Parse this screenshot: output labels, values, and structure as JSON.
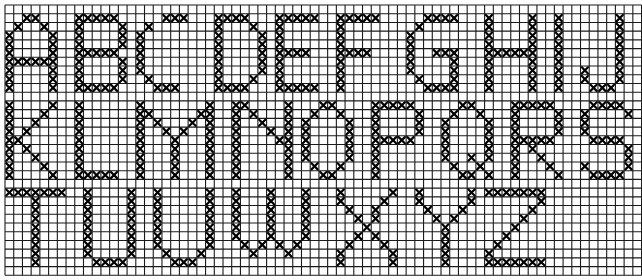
{
  "grid": {
    "origin_x": 5,
    "origin_y": 5,
    "pitch": 8.72,
    "cols": 73,
    "rows": 31,
    "line_color": "#1a1a1a",
    "stitch_color": "#000000"
  },
  "letters": [
    {
      "char": "A",
      "row0": 1,
      "col0": 0,
      "pattern": [
        "..XX..",
        ".X..X.",
        "X....X",
        "X....X",
        "X....X",
        "XXXXXX",
        "X....X",
        "X....X",
        "X....X"
      ]
    },
    {
      "char": "B",
      "row0": 1,
      "col0": 8,
      "pattern": [
        "XXXXX.",
        "X....X",
        "X....X",
        "X....X",
        "XXXXX.",
        "X....X",
        "X....X",
        "X....X",
        "XXXXX."
      ]
    },
    {
      "char": "C",
      "row0": 1,
      "col0": 15,
      "pattern": [
        "...XXX",
        ".X....",
        "X.....",
        "X.....",
        "X.....",
        "X.....",
        "X.....",
        ".X....",
        "..XXX."
      ]
    },
    {
      "char": "D",
      "row0": 1,
      "col0": 24,
      "pattern": [
        "XXXX..",
        "X...X.",
        "X....X",
        "X....X",
        "X....X",
        "X....X",
        "X....X",
        "X...X.",
        "XXXX.."
      ]
    },
    {
      "char": "E",
      "row0": 1,
      "col0": 31,
      "pattern": [
        "XXXXX",
        "X....",
        "X....",
        "X....",
        "XXXX.",
        "X....",
        "X....",
        "X....",
        "XXXXX"
      ]
    },
    {
      "char": "F",
      "row0": 1,
      "col0": 38,
      "pattern": [
        "XXXXX",
        "X....",
        "X....",
        "X....",
        "XXXX.",
        "X....",
        "X....",
        "X....",
        "X...."
      ]
    },
    {
      "char": "G",
      "row0": 1,
      "col0": 46,
      "pattern": [
        "..XXXX",
        ".X....",
        "X.....",
        "X.....",
        "X..XXX",
        "X....X",
        "X....X",
        ".X...X",
        "..XXXX"
      ]
    },
    {
      "char": "H",
      "row0": 1,
      "col0": 55,
      "pattern": [
        "X....X",
        "X....X",
        "X....X",
        "X....X",
        "XXXXXX",
        "X....X",
        "X....X",
        "X....X",
        "X....X"
      ]
    },
    {
      "char": "I",
      "row0": 1,
      "col0": 63,
      "pattern": [
        "X",
        "X",
        "X",
        "X",
        "X",
        "X",
        "X",
        "X",
        "X"
      ]
    },
    {
      "char": "J",
      "row0": 1,
      "col0": 66,
      "pattern": [
        "....X",
        "....X",
        "....X",
        "....X",
        "....X",
        "....X",
        "X...X",
        "X...X",
        ".XXX."
      ]
    },
    {
      "char": "K",
      "row0": 11,
      "col0": 0,
      "pattern": [
        "X....X",
        "X...X.",
        "X..X..",
        "X.X...",
        "XX....",
        "X.X...",
        "X..X..",
        "X...X.",
        "X....X"
      ]
    },
    {
      "char": "L",
      "row0": 11,
      "col0": 8,
      "pattern": [
        "X....",
        "X....",
        "X....",
        "X....",
        "X....",
        "X....",
        "X....",
        "X....",
        "XXXXX"
      ]
    },
    {
      "char": "M",
      "row0": 11,
      "col0": 15,
      "pattern": [
        "X.......X",
        "XX.....XX",
        "X.X...X.X",
        "X..X.X..X",
        "X...X...X",
        "X...X...X",
        "X...X...X",
        "X...X...X",
        "X...X...X"
      ]
    },
    {
      "char": "N",
      "row0": 11,
      "col0": 26,
      "pattern": [
        "XX....X",
        "X.X...X",
        "X..X..X",
        "X...X.X",
        "X....XX",
        "X.....X",
        "X.....X",
        "X.....X",
        "X.....X"
      ]
    },
    {
      "char": "O",
      "row0": 11,
      "col0": 34,
      "pattern": [
        "..XX..",
        ".X..X.",
        "X....X",
        "X....X",
        "X....X",
        "X....X",
        "X....X",
        ".X..X.",
        "..XX.."
      ]
    },
    {
      "char": "P",
      "row0": 11,
      "col0": 42,
      "pattern": [
        "XXXXX.",
        "X....X",
        "X....X",
        "X....X",
        "XXXXX.",
        "X.....",
        "X.....",
        "X.....",
        "X....."
      ]
    },
    {
      "char": "Q",
      "row0": 11,
      "col0": 50,
      "pattern": [
        "..XX..",
        ".X..X.",
        "X....X",
        "X....X",
        "X....X",
        "X....X",
        "X..X.X",
        ".X..X.",
        "..XX.X"
      ]
    },
    {
      "char": "R",
      "row0": 11,
      "col0": 58,
      "pattern": [
        "XXXXX.",
        "X....X",
        "X....X",
        "X....X",
        "XXXXX.",
        "X.X...",
        "X..X..",
        "X...X.",
        "X....X"
      ]
    },
    {
      "char": "S",
      "row0": 11,
      "col0": 66,
      "pattern": [
        ".XXXX.",
        "X....X",
        "X.....",
        "X.....",
        ".XXXX.",
        ".....X",
        ".....X",
        "X....X",
        ".XXXX."
      ]
    },
    {
      "char": "T",
      "row0": 21,
      "col0": 0,
      "pattern": [
        "XXXXXXX",
        "...X...",
        "...X...",
        "...X...",
        "...X...",
        "...X...",
        "...X...",
        "...X...",
        "...X..."
      ]
    },
    {
      "char": "U",
      "row0": 21,
      "col0": 9,
      "pattern": [
        "X....X",
        "X....X",
        "X....X",
        "X....X",
        "X....X",
        "X....X",
        "X....X",
        "X....X",
        ".XXXX."
      ]
    },
    {
      "char": "V",
      "row0": 21,
      "col0": 17,
      "pattern": [
        "X.....X",
        "X.....X",
        "X.....X",
        "X.....X",
        "X.....X",
        "X.....X",
        "X.....X",
        ".X...X.",
        "..XXX.."
      ]
    },
    {
      "char": "W",
      "row0": 21,
      "col0": 26,
      "pattern": [
        "X...X...X",
        "X...X...X",
        "X...X...X",
        "X...X...X",
        "X...X...X",
        "X...X...X",
        ".X.X.X.X.",
        "..X...X..",
        "........."
      ]
    },
    {
      "char": "X",
      "row0": 21,
      "col0": 38,
      "pattern": [
        "X.....X",
        "X....X.",
        ".X..X..",
        "..X.X..",
        "...X...",
        "..X.X..",
        ".X...X.",
        "X.....X",
        "X.....X"
      ]
    },
    {
      "char": "Y",
      "row0": 21,
      "col0": 47,
      "pattern": [
        "X.....X",
        "X.....X",
        ".X...X.",
        "..X.X..",
        "...X...",
        "...X...",
        "...X...",
        "...X...",
        "...X..."
      ]
    },
    {
      "char": "Z",
      "row0": 21,
      "col0": 55,
      "pattern": [
        "XXXXXXX",
        "......X",
        ".....X.",
        "....X..",
        "...X...",
        "..X....",
        ".X.....",
        "X......",
        "XXXXXXX"
      ]
    }
  ]
}
